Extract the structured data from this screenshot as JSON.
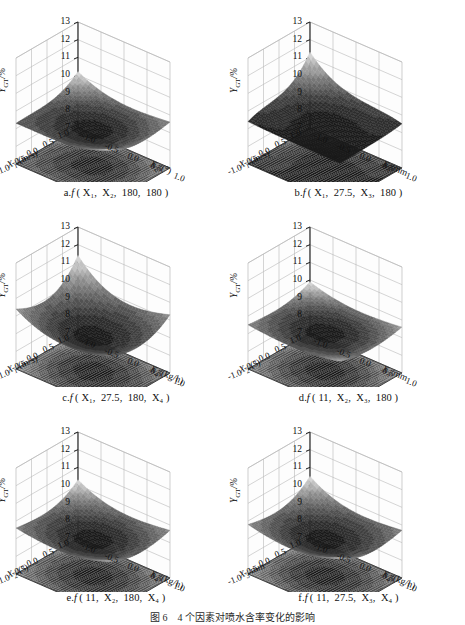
{
  "figure": {
    "caption": "图 6　4 个因素对喷水含率变化的影响",
    "zlabel_main": "Y",
    "zlabel_sub": "GT",
    "zlabel_unit": "/%"
  },
  "axes": {
    "z_ticks": [
      "13",
      "12",
      "11",
      "10",
      "9",
      "8",
      "7"
    ],
    "z_range": [
      7,
      13
    ],
    "h_ticks_left": [
      "1.0",
      "0.5",
      "0.0",
      "-0.5",
      "-1.0"
    ],
    "h_ticks_right": [
      "1.0",
      "0.5",
      "0.0",
      "-0.5",
      "-1.0"
    ],
    "h_range": [
      -1.0,
      1.0
    ]
  },
  "names": {
    "x1": "X",
    "x1_sub": "1",
    "x1_unit": "/(m/s)",
    "x2": "X",
    "x2_sub": "2",
    "x2_unit": "/(°)",
    "x3": "X",
    "x3_sub": "3",
    "x3_unit": "/mm",
    "x4": "X",
    "x4_sub": "4",
    "x4_unit": "/(kg/h)"
  },
  "panels": [
    {
      "id": "a",
      "caption_prefix": "a.",
      "caption_fn": "f",
      "caption_args": "( X₁, X₂, 180, 180 )",
      "left_axis": "x1",
      "right_axis": "x2",
      "surface": {
        "shape": "saddle-bowl",
        "z_center": 9.0,
        "z_edge_max": 10.4,
        "z_min": 8.6,
        "contour_levels": 9
      }
    },
    {
      "id": "b",
      "caption_prefix": "b.",
      "caption_fn": "f",
      "caption_args": "( X₁, 27.5, X₃, 180 )",
      "left_axis": "x1",
      "right_axis": "x3",
      "surface": {
        "shape": "steep-corner-rise",
        "z_center": 9.3,
        "z_edge_max": 11.3,
        "z_min": 8.7,
        "contour_levels": 9
      }
    },
    {
      "id": "c",
      "caption_prefix": "c.",
      "caption_fn": "f",
      "caption_args": "( X₁, 27.5, 180, X₄ )",
      "left_axis": "x1",
      "right_axis": "x4",
      "surface": {
        "shape": "deep-bowl",
        "z_center": 8.9,
        "z_edge_max": 11.4,
        "z_min": 8.5,
        "contour_levels": 10
      }
    },
    {
      "id": "d",
      "caption_prefix": "d.",
      "caption_fn": "f",
      "caption_args": "( 11, X₂, X₃, 180 )",
      "left_axis": "x2",
      "right_axis": "x3",
      "surface": {
        "shape": "shallow-bowl",
        "z_center": 9.1,
        "z_edge_max": 9.9,
        "z_min": 8.9,
        "contour_levels": 8
      }
    },
    {
      "id": "e",
      "caption_prefix": "e.",
      "caption_fn": "f",
      "caption_args": "( 11, X₂, 180, X₄ )",
      "left_axis": "x2",
      "right_axis": "x4",
      "surface": {
        "shape": "bowl",
        "z_center": 9.0,
        "z_edge_max": 10.3,
        "z_min": 8.7,
        "contour_levels": 9
      }
    },
    {
      "id": "f",
      "caption_prefix": "f.",
      "caption_fn": "f",
      "caption_args": "( 11, 27.5, X₃, X₄ )",
      "left_axis": "x3",
      "right_axis": "x4",
      "surface": {
        "shape": "bowl",
        "z_center": 9.0,
        "z_edge_max": 10.5,
        "z_min": 8.6,
        "contour_levels": 9
      }
    }
  ],
  "chart_data": {
    "type": "surface",
    "title": "图 6　4 个因素对喷水含率变化的影响",
    "zlabel": "Y_GT/%",
    "zlim": [
      7,
      13
    ],
    "z_ticks": [
      13,
      12,
      11,
      10,
      9,
      8,
      7
    ],
    "xlim": [
      -1.0,
      1.0
    ],
    "ylim": [
      -1.0,
      1.0
    ],
    "xy_ticks": [
      1.0,
      0.5,
      0.0,
      -0.5,
      -1.0
    ],
    "grid": true,
    "legend": "none",
    "colormap": "grayscale",
    "panels": [
      {
        "id": "a",
        "title": "a.f ( X1, X2, 180, 180 )",
        "xlabel": "X1/(m/s)",
        "ylabel": "X2/(°)",
        "surface_corners": {
          "x-y-": 10.2,
          "x+y-": 9.3,
          "x-y+": 9.6,
          "x+y+": 10.1
        },
        "surface_center": 9.0,
        "contour_projection_z": 7.0
      },
      {
        "id": "b",
        "title": "b.f ( X1, 27.5, X3, 180 )",
        "xlabel": "X1/(m/s)",
        "ylabel": "X3/mm",
        "surface_corners": {
          "x-y-": 11.3,
          "x+y-": 9.4,
          "x-y+": 9.5,
          "x+y+": 9.3
        },
        "surface_center": 9.3,
        "contour_projection_z": 7.0
      },
      {
        "id": "c",
        "title": "c.f ( X1, 27.5, 180, X4 )",
        "xlabel": "X1/(m/s)",
        "ylabel": "X4/(kg/h)",
        "surface_corners": {
          "x-y-": 11.4,
          "x+y-": 10.4,
          "x-y+": 10.3,
          "x+y+": 10.0
        },
        "surface_center": 8.9,
        "contour_projection_z": 7.0
      },
      {
        "id": "d",
        "title": "d.f ( 11, X2, X3, 180 )",
        "xlabel": "X2/(°)",
        "ylabel": "X3/mm",
        "surface_corners": {
          "x-y-": 9.9,
          "x+y-": 9.5,
          "x-y+": 9.6,
          "x+y+": 9.7
        },
        "surface_center": 9.1,
        "contour_projection_z": 7.0
      },
      {
        "id": "e",
        "title": "e.f ( 11, X2, 180, X4 )",
        "xlabel": "X2/(°)",
        "ylabel": "X4/(kg/h)",
        "surface_corners": {
          "x-y-": 10.3,
          "x+y-": 9.6,
          "x-y+": 9.7,
          "x+y+": 10.0
        },
        "surface_center": 9.0,
        "contour_projection_z": 7.0
      },
      {
        "id": "f",
        "title": "f.f ( 11, 27.5, X3, X4 )",
        "xlabel": "X3/mm",
        "ylabel": "X4/(kg/h)",
        "surface_corners": {
          "x-y-": 10.5,
          "x+y-": 9.8,
          "x-y+": 9.7,
          "x+y+": 10.2
        },
        "surface_center": 9.0,
        "contour_projection_z": 7.0
      }
    ]
  }
}
